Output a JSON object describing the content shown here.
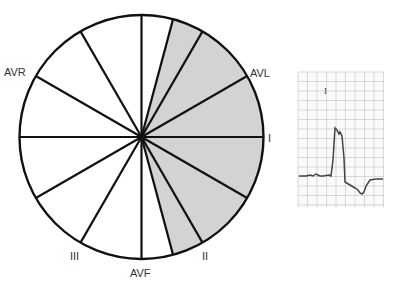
{
  "axis_labels": {
    "avr": "AVR",
    "avl": "AVL",
    "i": "I",
    "ii": "II",
    "iii": "III",
    "avf": "AVF"
  },
  "hexaxial": {
    "spoke_angles_deg": [
      -90,
      -75,
      -60,
      -30,
      0,
      30,
      60,
      75,
      90,
      120,
      150,
      180,
      210,
      240
    ],
    "shaded_range_deg": [
      -75,
      75
    ],
    "shade_color": "#d3d3d3"
  },
  "ecg": {
    "lead_label": "I",
    "grid_color": "#c9c9c9"
  }
}
